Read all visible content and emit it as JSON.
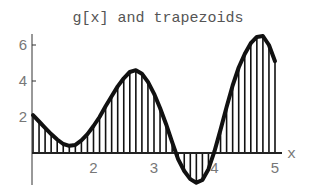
{
  "chart_data": {
    "type": "line",
    "title": "g[x] and trapezoids",
    "xlabel": "x",
    "ylabel": "",
    "xlim": [
      1,
      5
    ],
    "ylim": [
      -2,
      7
    ],
    "x_ticks": [
      2,
      3,
      4,
      5
    ],
    "y_ticks": [
      2,
      4,
      6
    ],
    "grid": false,
    "legend": null,
    "series": [
      {
        "name": "g[x]",
        "x": [
          1.0,
          1.1,
          1.2,
          1.3,
          1.4,
          1.5,
          1.6,
          1.7,
          1.8,
          1.9,
          2.0,
          2.1,
          2.2,
          2.3,
          2.4,
          2.5,
          2.6,
          2.7,
          2.8,
          2.9,
          3.0,
          3.1,
          3.2,
          3.3,
          3.4,
          3.5,
          3.6,
          3.7,
          3.8,
          3.9,
          4.0,
          4.1,
          4.2,
          4.3,
          4.4,
          4.5,
          4.6,
          4.7,
          4.8,
          4.9,
          5.0
        ],
        "values": [
          2.1,
          1.75,
          1.4,
          1.05,
          0.75,
          0.5,
          0.4,
          0.45,
          0.7,
          1.05,
          1.5,
          2.0,
          2.6,
          3.15,
          3.7,
          4.15,
          4.5,
          4.6,
          4.4,
          3.95,
          3.3,
          2.5,
          1.6,
          0.6,
          -0.35,
          -1.0,
          -1.45,
          -1.65,
          -1.5,
          -0.9,
          0.1,
          1.3,
          2.55,
          3.75,
          4.75,
          5.5,
          6.1,
          6.45,
          6.5,
          6.0,
          5.1
        ]
      }
    ],
    "annotations": [
      "vertical trapezoid lines at each sample point from x-axis to curve"
    ]
  },
  "colors": {
    "curve": "#111111",
    "trapezoid_lines": "#111111",
    "axis": "#222222",
    "text": "#666666"
  }
}
